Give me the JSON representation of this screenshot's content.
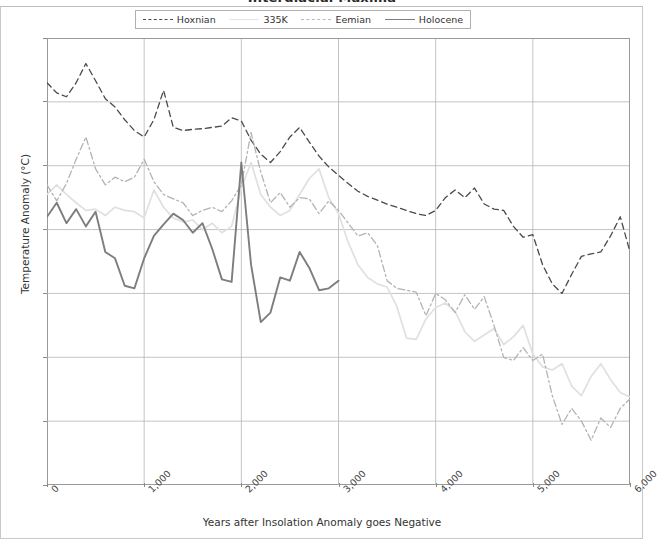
{
  "chart_data": {
    "type": "line",
    "title": "Interglacial Maxima",
    "xlabel": "Years after Insolation Anomaly goes Negative",
    "ylabel": "Temperature Anomaly (°C)",
    "xlim": [
      0,
      6000
    ],
    "ylim": [
      -4.0,
      3.0
    ],
    "xticks": [
      0,
      1000,
      2000,
      3000,
      4000,
      5000,
      6000
    ],
    "xticklabels": [
      "0",
      "1,000",
      "2,000",
      "3,000",
      "4,000",
      "5,000",
      "6,000"
    ],
    "yticks": [
      3.0,
      2.0,
      1.0,
      0.0,
      -1.0,
      -2.0,
      -3.0,
      -4.0
    ],
    "yticklabels": [
      "3.0",
      "2.0",
      "1.0",
      "0.0",
      "-1.0",
      "-2.0",
      "-3.0",
      "-4.0"
    ],
    "grid": true,
    "legend_position": "upper center",
    "series": [
      {
        "name": "Hoxnian",
        "style": "dashed",
        "color": "#4a4a4a",
        "width": 1.3,
        "x": [
          0,
          100,
          200,
          300,
          400,
          500,
          600,
          700,
          800,
          900,
          1000,
          1100,
          1200,
          1300,
          1400,
          1500,
          1600,
          1700,
          1800,
          1900,
          2000,
          2100,
          2200,
          2300,
          2400,
          2500,
          2600,
          2700,
          2800,
          2900,
          3000,
          3100,
          3200,
          3300,
          3400,
          3500,
          3600,
          3700,
          3800,
          3900,
          4000,
          4100,
          4200,
          4300,
          4400,
          4500,
          4600,
          4700,
          4800,
          4900,
          5000,
          5100,
          5200,
          5300,
          5400,
          5500,
          5600,
          5700,
          5800,
          5900,
          6000
        ],
        "y": [
          2.3,
          2.14,
          2.08,
          2.3,
          2.6,
          2.33,
          2.05,
          1.92,
          1.72,
          1.55,
          1.45,
          1.72,
          2.18,
          1.6,
          1.55,
          1.57,
          1.58,
          1.6,
          1.62,
          1.75,
          1.7,
          1.4,
          1.18,
          1.05,
          1.22,
          1.45,
          1.6,
          1.37,
          1.15,
          0.98,
          0.85,
          0.72,
          0.6,
          0.52,
          0.46,
          0.4,
          0.35,
          0.3,
          0.25,
          0.22,
          0.3,
          0.5,
          0.62,
          0.5,
          0.65,
          0.4,
          0.32,
          0.3,
          0.05,
          -0.12,
          -0.08,
          -0.55,
          -0.85,
          -1.0,
          -0.7,
          -0.42,
          -0.38,
          -0.35,
          -0.1,
          0.2,
          -0.35
        ]
      },
      {
        "name": "335K",
        "style": "solid-faint",
        "color": "#e0e0e0",
        "width": 1.7,
        "x": [
          0,
          100,
          200,
          300,
          400,
          500,
          600,
          700,
          800,
          900,
          1000,
          1100,
          1200,
          1300,
          1400,
          1500,
          1600,
          1700,
          1800,
          1900,
          2000,
          2100,
          2200,
          2300,
          2400,
          2500,
          2600,
          2700,
          2800,
          2900,
          3000,
          3100,
          3200,
          3300,
          3400,
          3500,
          3600,
          3700,
          3800,
          3900,
          4000,
          4100,
          4200,
          4300,
          4400,
          4500,
          4600,
          4700,
          4800,
          4900,
          5000,
          5100,
          5200,
          5300,
          5400,
          5500,
          5600,
          5700,
          5800,
          5900,
          6000
        ],
        "y": [
          0.55,
          0.7,
          0.55,
          0.42,
          0.3,
          0.32,
          0.22,
          0.35,
          0.3,
          0.28,
          0.18,
          0.62,
          0.35,
          0.18,
          0.12,
          0.15,
          0.0,
          0.1,
          -0.05,
          0.05,
          0.65,
          1.05,
          0.55,
          0.35,
          0.22,
          0.3,
          0.55,
          0.8,
          0.95,
          0.5,
          0.25,
          -0.2,
          -0.55,
          -0.75,
          -0.85,
          -0.9,
          -1.2,
          -1.7,
          -1.72,
          -1.4,
          -1.22,
          -1.15,
          -1.28,
          -1.6,
          -1.75,
          -1.65,
          -1.55,
          -1.8,
          -1.68,
          -1.5,
          -1.95,
          -2.15,
          -2.2,
          -2.1,
          -2.45,
          -2.6,
          -2.3,
          -2.1,
          -2.35,
          -2.55,
          -2.62
        ]
      },
      {
        "name": "Eemian",
        "style": "dashdot",
        "color": "#b3b3b3",
        "width": 1.3,
        "x": [
          0,
          100,
          200,
          300,
          400,
          500,
          600,
          700,
          800,
          900,
          1000,
          1100,
          1200,
          1300,
          1400,
          1500,
          1600,
          1700,
          1800,
          1900,
          2000,
          2100,
          2200,
          2300,
          2400,
          2500,
          2600,
          2700,
          2800,
          2900,
          3000,
          3100,
          3200,
          3300,
          3400,
          3500,
          3600,
          3700,
          3800,
          3900,
          4000,
          4100,
          4200,
          4300,
          4400,
          4500,
          4600,
          4700,
          4800,
          4900,
          5000,
          5100,
          5200,
          5300,
          5400,
          5500,
          5600,
          5700,
          5800,
          5900,
          6000
        ],
        "y": [
          0.7,
          0.45,
          0.72,
          1.1,
          1.45,
          0.95,
          0.7,
          0.82,
          0.75,
          0.82,
          1.1,
          0.75,
          0.55,
          0.48,
          0.42,
          0.22,
          0.3,
          0.35,
          0.28,
          0.45,
          0.7,
          1.52,
          0.9,
          0.42,
          0.58,
          0.35,
          0.5,
          0.48,
          0.25,
          0.45,
          0.3,
          0.1,
          -0.1,
          -0.05,
          -0.25,
          -0.8,
          -0.92,
          -0.95,
          -0.98,
          -1.35,
          -1.0,
          -1.1,
          -1.3,
          -1.02,
          -1.25,
          -1.05,
          -1.5,
          -2.0,
          -2.05,
          -1.85,
          -2.05,
          -1.95,
          -2.6,
          -3.05,
          -2.8,
          -3.0,
          -3.3,
          -2.95,
          -3.1,
          -2.8,
          -2.65
        ]
      },
      {
        "name": "Holocene",
        "style": "solid",
        "color": "#7d7d7d",
        "width": 1.9,
        "x": [
          0,
          100,
          200,
          300,
          400,
          500,
          600,
          700,
          800,
          900,
          1000,
          1100,
          1200,
          1300,
          1400,
          1500,
          1600,
          1700,
          1800,
          1900,
          2000,
          2100,
          2200,
          2300,
          2400,
          2500,
          2600,
          2700,
          2800,
          2900,
          3000
        ],
        "y": [
          0.2,
          0.42,
          0.1,
          0.32,
          0.05,
          0.28,
          -0.35,
          -0.45,
          -0.88,
          -0.92,
          -0.45,
          -0.1,
          0.08,
          0.25,
          0.15,
          -0.05,
          0.1,
          -0.3,
          -0.78,
          -0.82,
          1.05,
          -0.55,
          -1.45,
          -1.3,
          -0.75,
          -0.8,
          -0.35,
          -0.6,
          -0.95,
          -0.92,
          -0.8
        ]
      }
    ]
  }
}
